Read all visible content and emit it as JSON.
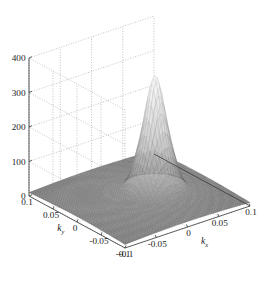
{
  "figure": {
    "kind": "matlab-3d-surface-mesh",
    "background_color": "#ffffff",
    "axis_color": "#3a3a3a",
    "grid_color": "#9a9a9a",
    "surface_low_color": "#6e6e6e",
    "surface_high_color": "#ffffff"
  },
  "chart_data": {
    "type": "surface",
    "title": "",
    "xlabel": "k_x",
    "ylabel": "k_y",
    "zlabel": "",
    "grid": true,
    "legend": "none",
    "x": {
      "name": "kx",
      "label": "k",
      "label_sub": "x",
      "ticks": [
        -0.1,
        -0.05,
        0,
        0.05,
        0.1
      ],
      "tick_labels": [
        "-0.1",
        "-0.05",
        "0",
        "0.05",
        "0.1"
      ],
      "range": [
        -0.1,
        0.1
      ]
    },
    "y": {
      "name": "ky",
      "label": "k",
      "label_sub": "y",
      "ticks": [
        -0.1,
        -0.05,
        0,
        0.05,
        0.1
      ],
      "tick_labels": [
        "-0.1",
        "-0.05",
        "0",
        "0.05",
        "0.1"
      ],
      "range": [
        -0.1,
        0.1
      ]
    },
    "z": {
      "name": "amplitude",
      "ticks": [
        0,
        100,
        200,
        300,
        400
      ],
      "tick_labels": [
        "0",
        "100",
        "200",
        "300",
        "400"
      ],
      "range": [
        0,
        400
      ]
    },
    "view": {
      "azimuth_deg": -37.5,
      "elevation_deg": 30
    },
    "surface_model": {
      "description": "Sharp narrow Gaussian-like peak over a low broad pedestal, peak offset toward +kx / 0 ky",
      "peak_value": 320,
      "peak_x": 0.022,
      "peak_y": -0.004,
      "peak_sigma_x": 0.016,
      "peak_sigma_y": 0.016,
      "pedestal_value": 22,
      "pedestal_sigma_x": 0.085,
      "pedestal_sigma_y": 0.085,
      "pedestal_x": 0.0,
      "pedestal_y": 0.0,
      "ripple_amplitude": 9,
      "ripple_wavelength": 0.03,
      "grid_n": 49
    }
  }
}
